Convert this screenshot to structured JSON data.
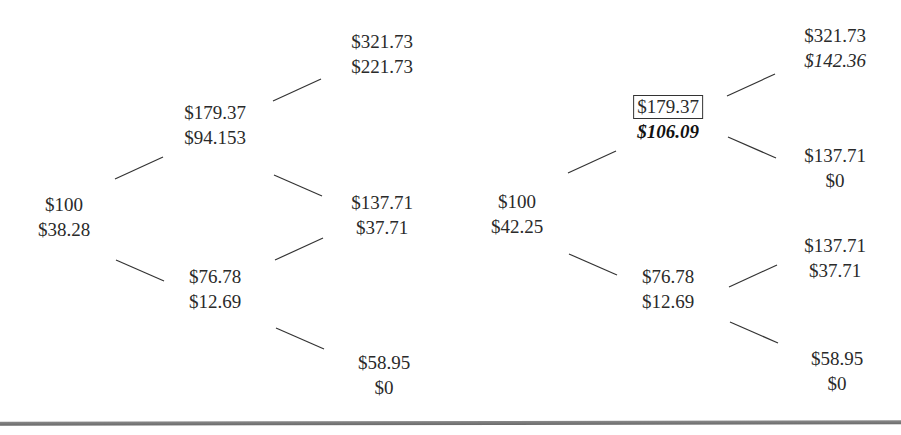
{
  "left_tree": {
    "root": {
      "price": "$100",
      "value": "$38.28"
    },
    "up": {
      "price": "$179.37",
      "value": "$94.153"
    },
    "down": {
      "price": "$76.78",
      "value": "$12.69"
    },
    "uu": {
      "price": "$321.73",
      "value": "$221.73"
    },
    "ud": {
      "price": "$137.71",
      "value": "$37.71"
    },
    "dd": {
      "price": "$58.95",
      "value": "$0"
    }
  },
  "right_tree": {
    "root": {
      "price": "$100",
      "value": "$42.25"
    },
    "up": {
      "price": "$179.37",
      "value": "$106.09",
      "price_boxed": true,
      "value_style": "bold-italic"
    },
    "down": {
      "price": "$76.78",
      "value": "$12.69"
    },
    "uu": {
      "price": "$321.73",
      "value": "$142.36",
      "value_style": "italic"
    },
    "ud_from_up": {
      "price": "$137.71",
      "value": "$0"
    },
    "ud_from_down": {
      "price": "$137.71",
      "value": "$37.71"
    },
    "dd": {
      "price": "$58.95",
      "value": "$0"
    }
  }
}
